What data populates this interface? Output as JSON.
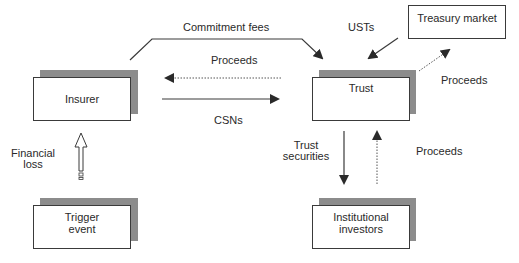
{
  "nodes": {
    "insurer": {
      "label": "Insurer"
    },
    "trust": {
      "label": "Trust"
    },
    "treasury_market": {
      "label": "Treasury market"
    },
    "trigger_event": {
      "line1": "Trigger",
      "line2": "event"
    },
    "institutional_investors": {
      "line1": "Institutional",
      "line2": "investors"
    }
  },
  "edges": {
    "commitment_fees": {
      "label": "Commitment fees",
      "from": "Insurer",
      "to": "Trust",
      "style": "solid"
    },
    "proceeds_trust_to_insurer": {
      "label": "Proceeds",
      "from": "Trust",
      "to": "Insurer",
      "style": "dotted"
    },
    "csns": {
      "label": "CSNs",
      "from": "Insurer",
      "to": "Trust",
      "style": "solid"
    },
    "usts": {
      "label": "USTs",
      "from": "Treasury market",
      "to": "Trust",
      "style": "solid"
    },
    "proceeds_trust_to_treasury": {
      "label": "Proceeds",
      "from": "Trust",
      "to": "Treasury market",
      "style": "dotted"
    },
    "trust_securities": {
      "line1": "Trust",
      "line2": "securities",
      "from": "Trust",
      "to": "Institutional investors",
      "style": "solid"
    },
    "proceeds_investors_to_trust": {
      "label": "Proceeds",
      "from": "Institutional investors",
      "to": "Trust",
      "style": "dotted"
    },
    "financial_loss": {
      "line1": "Financial",
      "line2": "loss",
      "from": "Trigger event",
      "to": "Insurer",
      "style": "hollow"
    }
  },
  "colors": {
    "shadow": "#8c8c8c",
    "stroke": "#3a3a3a",
    "text": "#2a2a2a"
  }
}
